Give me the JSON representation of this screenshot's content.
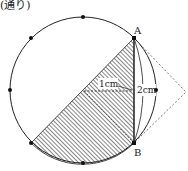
{
  "caption": "(通り)",
  "figure": {
    "labels": {
      "point_a": "A",
      "point_b": "B",
      "length_1": "1cm",
      "length_2": "2cm"
    },
    "colors": {
      "stroke": "#222222",
      "hatch": "#333333",
      "dash": "#555555"
    }
  }
}
